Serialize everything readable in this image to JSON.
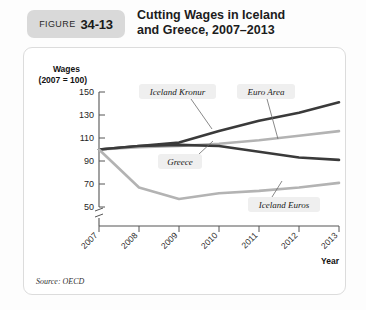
{
  "header": {
    "badge_word": "FIGURE",
    "badge_number": "34-13",
    "title_line1": "Cutting Wages in Iceland",
    "title_line2": "and Greece, 2007–2013"
  },
  "source": "Source: OECD",
  "colors": {
    "dark_line": "#3a3a3a",
    "light_line": "#b3b3b3",
    "badge_bg": "#d9d9d9",
    "card_border": "#dcdcdc",
    "label_pill_bg": "#efefef",
    "axis": "#555555"
  },
  "chart_data": {
    "type": "line",
    "title": "Cutting Wages in Iceland and Greece, 2007–2013",
    "xlabel": "Year",
    "ylabel": "Wages (2007 = 100)",
    "ylabel_line1": "Wages",
    "ylabel_line2": "(2007 = 100)",
    "categories": [
      "2007",
      "2008",
      "2009",
      "2010",
      "2011",
      "2012",
      "2013"
    ],
    "x": [
      2007,
      2008,
      2009,
      2010,
      2011,
      2012,
      2013
    ],
    "yticks": [
      50,
      70,
      90,
      110,
      130,
      150
    ],
    "ylim": [
      46,
      158
    ],
    "axis_break": true,
    "grid": false,
    "legend": "inline-labels",
    "series": [
      {
        "name": "Iceland Kronur",
        "color": "#3a3a3a",
        "values": [
          100,
          103,
          106,
          116,
          125,
          132,
          141
        ],
        "label_x": 2009.1,
        "label_y": 147
      },
      {
        "name": "Euro Area",
        "color": "#b3b3b3",
        "values": [
          100,
          102,
          103,
          105,
          108,
          112,
          116
        ],
        "label_x": 2011.15,
        "label_y": 147
      },
      {
        "name": "Greece",
        "color": "#3a3a3a",
        "values": [
          100,
          103,
          104,
          103,
          98,
          93,
          91
        ],
        "label_x": 2009.35,
        "label_y": 96
      },
      {
        "name": "Iceland Euros",
        "color": "#b3b3b3",
        "values": [
          100,
          67,
          57,
          62,
          64,
          67,
          71
        ],
        "label_x": 2011.5,
        "label_y": 61
      }
    ]
  }
}
